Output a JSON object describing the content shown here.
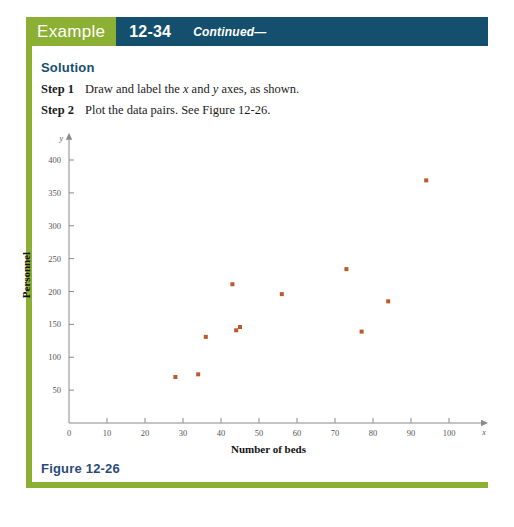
{
  "header": {
    "example_label": "Example",
    "number": "12-34",
    "continued": "Continued—",
    "green": "#8cb033",
    "blue": "#14506e"
  },
  "body": {
    "solution_heading": "Solution",
    "step1_label": "Step 1",
    "step1_text_a": "Draw and label the ",
    "step1_x": "x",
    "step1_text_b": " and ",
    "step1_y": "y",
    "step1_text_c": " axes, as shown.",
    "step2_label": "Step 2",
    "step2_text": "Plot the data pairs. See Figure 12-26."
  },
  "figure_caption": "Figure 12-26",
  "chart_data": {
    "type": "scatter",
    "title": "",
    "xlabel": "Number of beds",
    "ylabel": "Personnel",
    "x_axis_var": "x",
    "y_axis_var": "y",
    "xlim": [
      0,
      105
    ],
    "ylim": [
      0,
      420
    ],
    "xticks": [
      0,
      10,
      20,
      30,
      40,
      50,
      60,
      70,
      80,
      90,
      100
    ],
    "yticks": [
      50,
      100,
      150,
      200,
      250,
      300,
      350,
      400
    ],
    "grid": false,
    "legend": "none",
    "marker_color": "#c0562c",
    "points": [
      {
        "x": 28,
        "y": 70
      },
      {
        "x": 34,
        "y": 74
      },
      {
        "x": 36,
        "y": 131
      },
      {
        "x": 43,
        "y": 211
      },
      {
        "x": 44,
        "y": 141
      },
      {
        "x": 45,
        "y": 146
      },
      {
        "x": 56,
        "y": 196
      },
      {
        "x": 73,
        "y": 234
      },
      {
        "x": 77,
        "y": 139
      },
      {
        "x": 84,
        "y": 185
      },
      {
        "x": 94,
        "y": 369
      }
    ]
  }
}
